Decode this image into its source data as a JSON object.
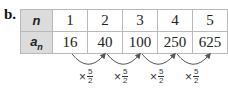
{
  "part_label": "b.",
  "table": {
    "rows": [
      {
        "header": "n",
        "values": [
          "1",
          "2",
          "3",
          "4",
          "5"
        ]
      },
      {
        "header": "a",
        "header_sub": "n",
        "values": [
          "16",
          "40",
          "100",
          "250",
          "625"
        ]
      }
    ]
  },
  "ratios": [
    {
      "symbol": "×",
      "numerator": "5",
      "denominator": "2"
    },
    {
      "symbol": "×",
      "numerator": "5",
      "denominator": "2"
    },
    {
      "symbol": "×",
      "numerator": "5",
      "denominator": "2"
    },
    {
      "symbol": "×",
      "numerator": "5",
      "denominator": "2"
    }
  ],
  "colors": {
    "header_bg": "#dcdcdc",
    "border": "#b9b9b9",
    "arrow": "#555555"
  }
}
